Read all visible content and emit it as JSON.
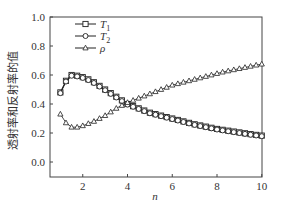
{
  "chart_data": {
    "type": "line",
    "title": "",
    "xlabel": "n",
    "ylabel": "透射率和反射率的值",
    "xlim": [
      0.55,
      10
    ],
    "ylim": [
      -0.1,
      1.0
    ],
    "xticks": [
      2,
      4,
      6,
      8,
      10
    ],
    "yticks": [
      0.0,
      0.2,
      0.4,
      0.6,
      0.8,
      1.0
    ],
    "ytick_labels": [
      "0.0",
      "0.2",
      "0.4",
      "0.6",
      "0.8",
      "1.0"
    ],
    "grid": false,
    "legend_position": "upper left",
    "x": [
      1,
      1.25,
      1.5,
      1.75,
      2,
      2.25,
      2.5,
      2.75,
      3,
      3.25,
      3.5,
      3.75,
      4,
      4.25,
      4.5,
      4.75,
      5,
      5.25,
      5.5,
      5.75,
      6,
      6.25,
      6.5,
      6.75,
      7,
      7.25,
      7.5,
      7.75,
      8,
      8.25,
      8.5,
      8.75,
      9,
      9.25,
      9.5,
      9.75,
      10
    ],
    "series": [
      {
        "name": "T1",
        "label_main": "T",
        "label_sub": "1",
        "marker": "square",
        "values": [
          0.48,
          0.56,
          0.6,
          0.595,
          0.585,
          0.57,
          0.55,
          0.525,
          0.5,
          0.475,
          0.45,
          0.425,
          0.4,
          0.385,
          0.37,
          0.355,
          0.34,
          0.33,
          0.32,
          0.31,
          0.3,
          0.29,
          0.28,
          0.27,
          0.26,
          0.252,
          0.244,
          0.236,
          0.228,
          0.222,
          0.216,
          0.21,
          0.204,
          0.198,
          0.192,
          0.187,
          0.182
        ]
      },
      {
        "name": "T2",
        "label_main": "T",
        "label_sub": "2",
        "marker": "circle",
        "values": [
          0.475,
          0.555,
          0.595,
          0.59,
          0.58,
          0.565,
          0.545,
          0.52,
          0.495,
          0.47,
          0.445,
          0.42,
          0.396,
          0.381,
          0.366,
          0.351,
          0.336,
          0.326,
          0.316,
          0.306,
          0.296,
          0.286,
          0.276,
          0.266,
          0.256,
          0.248,
          0.24,
          0.232,
          0.224,
          0.218,
          0.212,
          0.206,
          0.2,
          0.194,
          0.188,
          0.183,
          0.178
        ]
      },
      {
        "name": "ρ",
        "label_main": "ρ",
        "label_sub": "",
        "marker": "triangle",
        "values": [
          0.33,
          0.27,
          0.24,
          0.24,
          0.25,
          0.265,
          0.28,
          0.3,
          0.32,
          0.345,
          0.37,
          0.39,
          0.41,
          0.425,
          0.44,
          0.455,
          0.47,
          0.485,
          0.5,
          0.515,
          0.53,
          0.54,
          0.55,
          0.56,
          0.57,
          0.58,
          0.59,
          0.6,
          0.61,
          0.62,
          0.628,
          0.636,
          0.644,
          0.652,
          0.66,
          0.668,
          0.675
        ]
      }
    ]
  },
  "colors": {
    "axis": "#444444",
    "line": "#222222",
    "marker_fill": "#ffffff"
  }
}
